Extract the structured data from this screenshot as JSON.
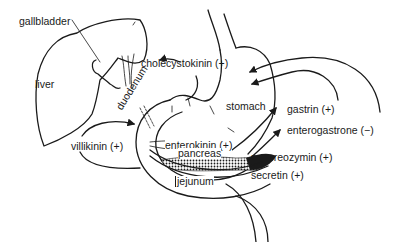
{
  "figure": {
    "type": "anatomical hormone-action diagram",
    "organs": {
      "gallbladder": "gallbladder",
      "liver": "liver",
      "duodenum": "duodenum",
      "stomach": "stomach",
      "pancreas": "pancreas",
      "jejunum": "jejunum"
    },
    "hormones": {
      "cholecystokinin": "cholecystokinin (+)",
      "gastrin": "gastrin (+)",
      "enterogastrone": "enterogastrone (−)",
      "villikinin": "villikinin (+)",
      "enterokinin": "enterokinin (+)",
      "pancreozymin": "pancreozymin (+)",
      "secretin": "secretin (+)"
    },
    "colors": {
      "ink": "#1a1a1a",
      "background": "#ffffff"
    }
  }
}
